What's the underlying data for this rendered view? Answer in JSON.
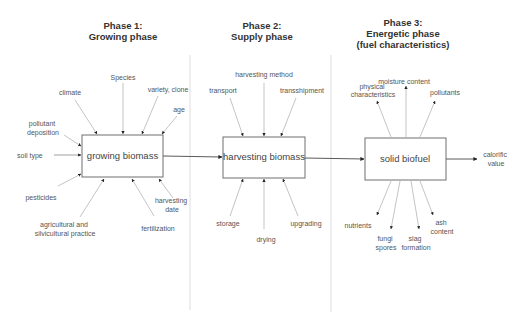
{
  "phases": [
    {
      "title_line1": "Phase 1:",
      "title_line2": "Growing phase",
      "box_label": "growing biomass",
      "factors": {
        "species": "Species",
        "climate": "climate",
        "variety": "variety, clone",
        "age": "age",
        "pollutant_1": "pollutant",
        "pollutant_2": "deposition",
        "soil_type": "soil type",
        "pesticides": "pesticides",
        "practice_1": "agricultural and",
        "practice_2": "silvicultural practice",
        "fertilization": "fertilization",
        "harvest_date_1": "harvesting",
        "harvest_date_2": "date"
      }
    },
    {
      "title_line1": "Phase 2:",
      "title_line2": "Supply phase",
      "box_label": "harvesting biomass",
      "factors": {
        "harvesting_method": "harvesting method",
        "transport": "transport",
        "transshipment": "transshipment",
        "storage": "storage",
        "drying": "drying",
        "upgrading": "upgrading"
      }
    },
    {
      "title_line1": "Phase 3:",
      "title_line2": "Energetic phase",
      "title_line3": "(fuel characteristics)",
      "box_label": "solid biofuel",
      "outputs": {
        "physical_1": "physical",
        "physical_2": "characteristics",
        "moisture": "moisture content",
        "pollutants": "pollutants",
        "calorific_1": "calorific",
        "calorific_2": "value",
        "nutrients": "nutrients",
        "fungi_1": "fungi",
        "fungi_2": "spores",
        "slag_1": "slag",
        "slag_2": "formation",
        "ash_1": "ash",
        "ash_2": "content"
      }
    }
  ],
  "colors": {
    "box_stroke": "#6f6f6f",
    "arrow": "#b5b5b5",
    "flow_arrow": "#5a5a5a",
    "divider": "#e3e3e3",
    "text": "#555555"
  }
}
